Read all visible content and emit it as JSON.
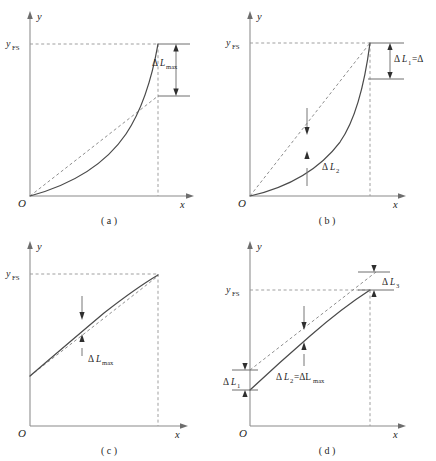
{
  "figure": {
    "axis_x_label": "x",
    "axis_y_label": "y",
    "origin_label": "O",
    "yfs_base": "y",
    "yfs_sub": "FS",
    "colors": {
      "curve": "#4a4a4a",
      "dashed": "#8f8f8f",
      "axis": "#8a8a8a",
      "text": "#1f1f1f",
      "background": "#ffffff"
    }
  },
  "panels": [
    {
      "id": "a",
      "caption": "( a )",
      "axis_x_label": "x",
      "axis_y_label": "y",
      "origin_label": "O",
      "yfs_base": "y",
      "yfs_sub": "FS",
      "curve_shape": "concave-up from origin to full-scale",
      "reference_line": "endpoint line from origin",
      "annotations": [
        {
          "name": "delta-l-max",
          "delta": "Δ",
          "var": "L",
          "sub": "max",
          "style": "bracket-right",
          "orientation": "vertical-double-arrow"
        }
      ]
    },
    {
      "id": "b",
      "caption": "( b )",
      "axis_x_label": "x",
      "axis_y_label": "y",
      "origin_label": "O",
      "yfs_base": "y",
      "yfs_sub": "FS",
      "curve_shape": "strongly concave-up below chord",
      "reference_line": "chord from origin to full-scale point",
      "annotations": [
        {
          "name": "delta-l-1",
          "delta": "Δ",
          "var": "L",
          "sub": "1",
          "suffix": "=Δ",
          "style": "bracket-right",
          "orientation": "vertical-double-arrow"
        },
        {
          "name": "delta-l-2",
          "delta": "Δ",
          "var": "L",
          "sub": "2",
          "suffix": "",
          "style": "inline-gap",
          "orientation": "vertical-opposed-arrows"
        }
      ]
    },
    {
      "id": "c",
      "caption": "( c )",
      "axis_x_label": "x",
      "axis_y_label": "y",
      "origin_label": "O",
      "yfs_base": "y",
      "yfs_sub": "FS",
      "curve_shape": "concave-down starting above origin",
      "reference_line": "chord from curve start to full-scale point",
      "annotations": [
        {
          "name": "delta-l-max",
          "delta": "Δ",
          "var": "L",
          "sub": "max",
          "suffix": "",
          "style": "inline-gap",
          "orientation": "vertical-opposed-arrows"
        }
      ]
    },
    {
      "id": "d",
      "caption": "( d )",
      "axis_x_label": "x",
      "axis_y_label": "y",
      "origin_label": "O",
      "yfs_base": "y",
      "yfs_sub": "FS",
      "curve_shape": "concave-down starting above origin, best-fit line offset",
      "reference_line": "independent best-fit straight line",
      "annotations": [
        {
          "name": "delta-l-1",
          "delta": "Δ",
          "var": "L",
          "sub": "1",
          "suffix": "",
          "style": "bracket-left",
          "orientation": "vertical-opposed-arrows"
        },
        {
          "name": "delta-l-2",
          "delta": "Δ",
          "var": "L",
          "sub": "2",
          "suffix": "=ΔL",
          "sub2": "max",
          "style": "inline-gap",
          "orientation": "vertical-opposed-arrows"
        },
        {
          "name": "delta-l-3",
          "delta": "Δ",
          "var": "L",
          "sub": "3",
          "suffix": "",
          "style": "bracket-right",
          "orientation": "vertical-opposed-arrows"
        }
      ]
    }
  ]
}
